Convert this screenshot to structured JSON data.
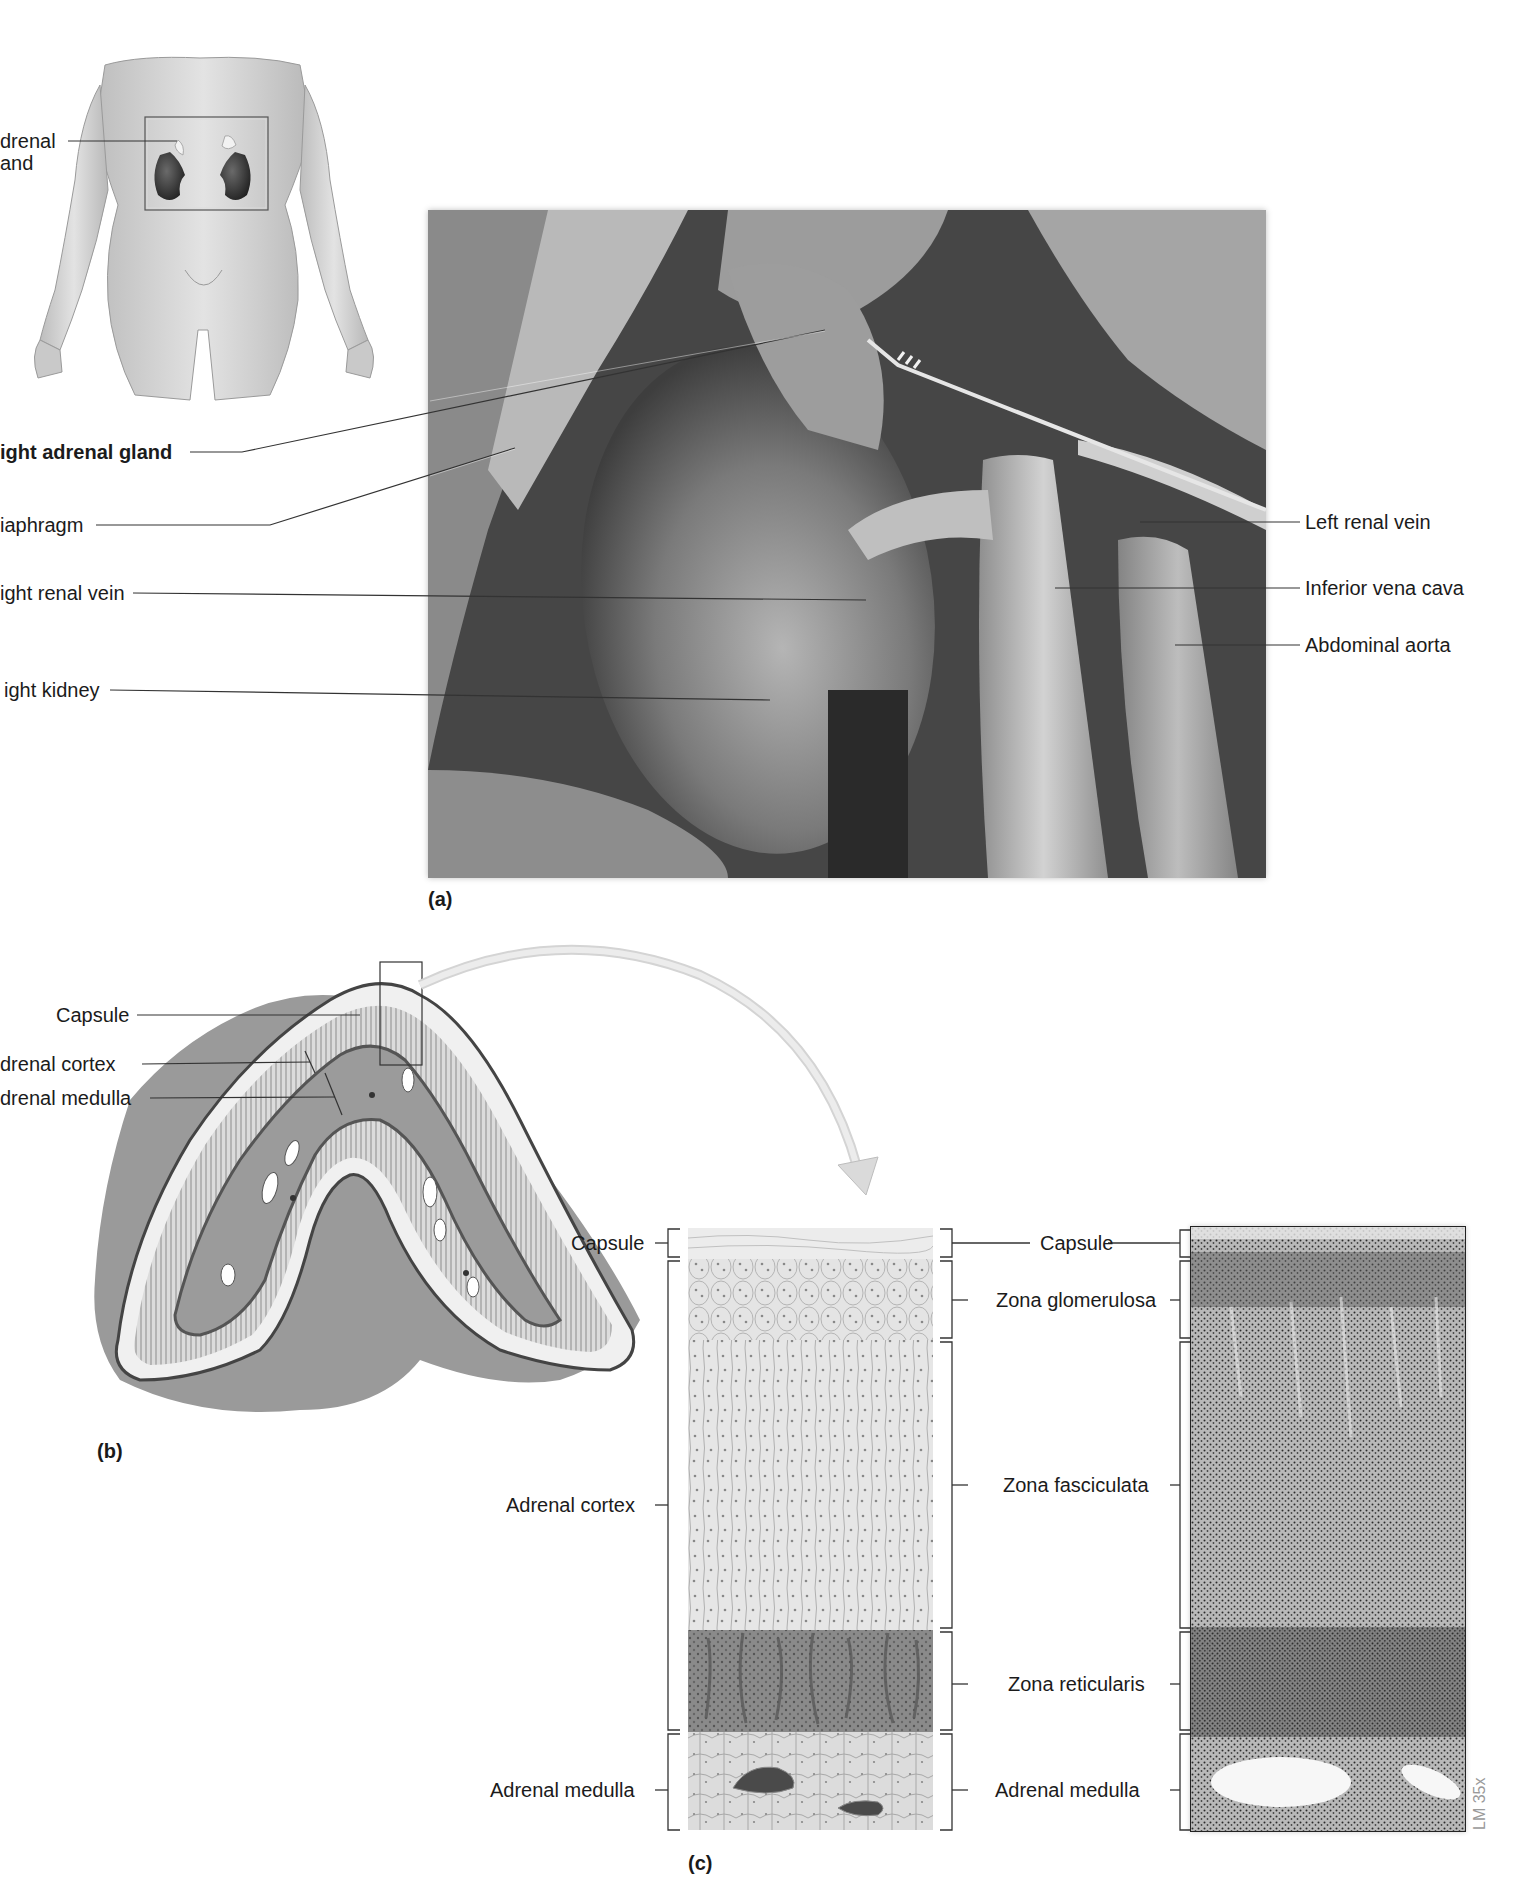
{
  "figure": {
    "panels": [
      {
        "id": "a",
        "tag": "(a)"
      },
      {
        "id": "b",
        "tag": "(b)"
      },
      {
        "id": "c",
        "tag": "(c)"
      }
    ]
  },
  "panel_a": {
    "inset_label": {
      "line1": "drenal",
      "line2": "and"
    },
    "left_labels": [
      {
        "text": "ight adrenal gland",
        "bold": true
      },
      {
        "text": "iaphragm",
        "bold": false
      },
      {
        "text": "ight renal vein",
        "bold": false
      },
      {
        "text": "ight kidney",
        "bold": false
      }
    ],
    "right_labels": [
      {
        "text": "Left renal vein"
      },
      {
        "text": "Inferior vena cava"
      },
      {
        "text": "Abdominal aorta"
      }
    ]
  },
  "panel_b": {
    "labels": [
      {
        "text": "Capsule"
      },
      {
        "text": "drenal cortex"
      },
      {
        "text": "drenal medulla"
      }
    ]
  },
  "panel_c": {
    "left_labels": [
      {
        "text": "Capsule"
      },
      {
        "text": "Adrenal cortex"
      },
      {
        "text": "Adrenal medulla"
      }
    ],
    "right_labels": [
      {
        "text": "Capsule"
      },
      {
        "text": "Zona glomerulosa"
      },
      {
        "text": "Zona fasciculata"
      },
      {
        "text": "Zona reticularis"
      },
      {
        "text": "Adrenal medulla"
      }
    ],
    "micrograph_scale": "LM 35x"
  },
  "colors": {
    "leader_line": "#333333",
    "capsule": "#e6e6e6",
    "glomerulosa": "#d4d4d4",
    "fasciculata": "#e2e2e2",
    "reticularis": "#7d7d7d",
    "medulla": "#d0d0d0"
  }
}
